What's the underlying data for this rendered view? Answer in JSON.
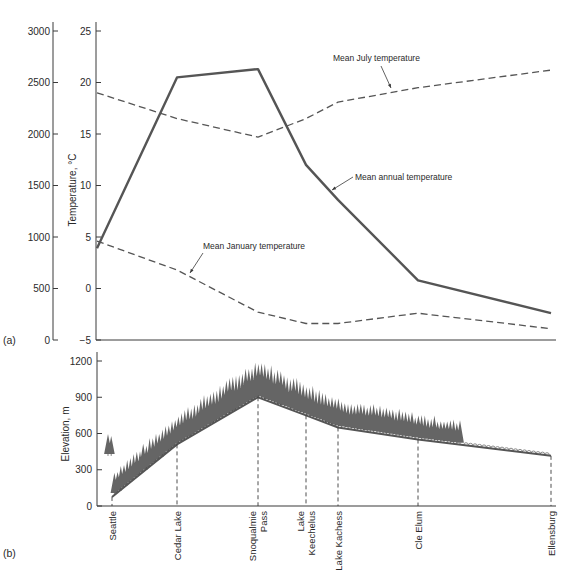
{
  "figure": {
    "panel_a_label": "(a)",
    "panel_b_label": "(b)"
  },
  "chart_data": [
    {
      "id": "panel-a",
      "type": "line",
      "title": "",
      "xlabel": "",
      "ylabel": "Temperature, °C",
      "ylabel_left_secondary": "",
      "categories": [
        "Seattle",
        "Cedar Lake",
        "Snoqualmie Pass",
        "Lake Keechelus",
        "Lake Kachess",
        "Cle Elum",
        "Ellensburg"
      ],
      "yaxis_primary": {
        "ticks": [
          -5,
          0,
          5,
          10,
          15,
          20,
          25
        ],
        "ylim": [
          -5,
          25
        ],
        "label": "Temperature, °C"
      },
      "yaxis_secondary": {
        "ticks": [
          0,
          500,
          1000,
          1500,
          2000,
          2500,
          3000
        ],
        "ylim": [
          0,
          3000
        ],
        "label": ""
      },
      "grid": false,
      "series": [
        {
          "name": "Mean annual temperature",
          "style": "solid",
          "values": [
            3.9,
            20.5,
            21.3,
            12.0,
            8.6,
            0.8,
            -2.4
          ],
          "annotation": {
            "text": "Mean annual temperature"
          }
        },
        {
          "name": "Mean July temperature",
          "style": "dashed",
          "values": [
            19.0,
            16.5,
            14.7,
            16.5,
            18.1,
            19.5,
            21.2
          ],
          "annotation": {
            "text": "Mean July temperature"
          }
        },
        {
          "name": "Mean January temperature",
          "style": "dashed",
          "values": [
            4.6,
            1.8,
            -2.3,
            -3.4,
            -3.4,
            -2.4,
            -3.9
          ],
          "annotation": {
            "text": "Mean January temperature"
          }
        }
      ]
    },
    {
      "id": "panel-b",
      "type": "area",
      "title": "",
      "xlabel": "",
      "ylabel": "Elevation, m",
      "categories": [
        "Seattle",
        "Cedar Lake",
        "Snoqualmie Pass",
        "Lake Keechelus",
        "Lake Kachess",
        "Cle Elum",
        "Ellensburg"
      ],
      "category_labels": [
        [
          "Seattle"
        ],
        [
          "Cedar Lake"
        ],
        [
          "Snoqualmie",
          "Pass"
        ],
        [
          "Lake",
          "Keechelus"
        ],
        [
          "Lake Kachess"
        ],
        [
          "Cle Elum"
        ],
        [
          "Ellensburg"
        ]
      ],
      "yaxis": {
        "ticks": [
          0,
          300,
          600,
          900,
          1200
        ],
        "ylim": [
          0,
          1200
        ],
        "label": "Elevation, m"
      },
      "grid": false,
      "series": [
        {
          "name": "Ground elevation profile",
          "values": [
            75,
            510,
            900,
            750,
            650,
            550,
            415
          ]
        }
      ],
      "vegetation": "Conifer forest from Seattle to east of Cle Elum; low shrub/grass cover toward Ellensburg"
    }
  ],
  "colors": {
    "ink": "#3a3a3a",
    "line": "#555555",
    "tree": "#4a4a4a",
    "shrub": "#8a8a8a"
  }
}
